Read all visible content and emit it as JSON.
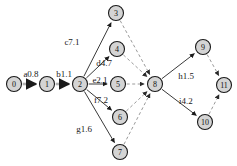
{
  "diagram": {
    "type": "directed-graph",
    "title": "",
    "nodes": [
      {
        "id": "0",
        "label": "0",
        "x": 14,
        "y": 84
      },
      {
        "id": "1",
        "label": "1",
        "x": 47,
        "y": 84
      },
      {
        "id": "2",
        "label": "2",
        "x": 80,
        "y": 84
      },
      {
        "id": "3",
        "label": "3",
        "x": 116,
        "y": 13
      },
      {
        "id": "4",
        "label": "4",
        "x": 117,
        "y": 49
      },
      {
        "id": "5",
        "label": "5",
        "x": 118,
        "y": 84
      },
      {
        "id": "6",
        "label": "6",
        "x": 120,
        "y": 117
      },
      {
        "id": "7",
        "label": "7",
        "x": 120,
        "y": 152
      },
      {
        "id": "8",
        "label": "8",
        "x": 155,
        "y": 84
      },
      {
        "id": "9",
        "label": "9",
        "x": 203,
        "y": 47
      },
      {
        "id": "10",
        "label": "10",
        "x": 205,
        "y": 122
      },
      {
        "id": "11",
        "label": "11",
        "x": 224,
        "y": 85
      }
    ],
    "node_radius": 7.5,
    "edges": [
      {
        "from": "0",
        "to": "1",
        "label": "a0.8",
        "style": "thick-gray",
        "label_x": 31,
        "label_y": 74
      },
      {
        "from": "1",
        "to": "2",
        "label": "b1.1",
        "style": "thick-gray",
        "label_x": 64,
        "label_y": 74
      },
      {
        "from": "2",
        "to": "3",
        "label": "c7.1",
        "style": "solid",
        "label_x": 72,
        "label_y": 42
      },
      {
        "from": "2",
        "to": "4",
        "label": "d4.7",
        "style": "solid",
        "label_x": 104,
        "label_y": 63
      },
      {
        "from": "2",
        "to": "5",
        "label": "e2.1",
        "style": "solid",
        "label_x": 100,
        "label_y": 80
      },
      {
        "from": "2",
        "to": "6",
        "label": "f7.2",
        "style": "solid",
        "label_x": 101,
        "label_y": 100
      },
      {
        "from": "2",
        "to": "7",
        "label": "g1.6",
        "style": "solid",
        "label_x": 84,
        "label_y": 129
      },
      {
        "from": "3",
        "to": "8",
        "label": "",
        "style": "dashed"
      },
      {
        "from": "4",
        "to": "8",
        "label": "",
        "style": "dashed"
      },
      {
        "from": "5",
        "to": "8",
        "label": "",
        "style": "dashed"
      },
      {
        "from": "6",
        "to": "8",
        "label": "",
        "style": "dashed"
      },
      {
        "from": "7",
        "to": "8",
        "label": "",
        "style": "dashed"
      },
      {
        "from": "8",
        "to": "9",
        "label": "h1.5",
        "style": "solid",
        "label_x": 186,
        "label_y": 76
      },
      {
        "from": "8",
        "to": "10",
        "label": "i4.2",
        "style": "solid",
        "label_x": 186,
        "label_y": 101
      },
      {
        "from": "9",
        "to": "11",
        "label": "",
        "style": "dashed"
      },
      {
        "from": "10",
        "to": "11",
        "label": "",
        "style": "dashed"
      }
    ],
    "colors": {
      "node_fill": "#d4d4d4",
      "node_stroke": "#1a1a1a",
      "edge_solid": "#3a3a3a",
      "edge_dashed": "#9a9a9a",
      "edge_thick_gray": "#b0b0b0",
      "background": "#ffffff"
    }
  }
}
